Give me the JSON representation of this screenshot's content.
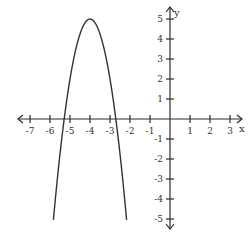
{
  "chart_data": {
    "type": "line",
    "title": "",
    "xlabel": "x",
    "ylabel": "y",
    "xlim": [
      -7.6,
      3.6
    ],
    "ylim": [
      -5.5,
      5.6
    ],
    "x_ticks": [
      -7,
      -6,
      -5,
      -4,
      -3,
      -2,
      -1,
      1,
      2,
      3
    ],
    "y_ticks": [
      -5,
      -4,
      -3,
      -2,
      -1,
      1,
      2,
      3,
      4,
      5
    ],
    "x_tick_labels": [
      "-7",
      "-6",
      "-5",
      "-4",
      "-3",
      "-2",
      "-1",
      "1",
      "2",
      "3"
    ],
    "y_tick_labels": [
      "-5",
      "-4",
      "-3",
      "-2",
      "-1",
      "1",
      "2",
      "3",
      "4",
      "5"
    ],
    "grid": false,
    "series": [
      {
        "name": "parabola",
        "equation": "y = -3(x + 4)^2 + 5",
        "vertex": [
          -4,
          5
        ],
        "x_intercepts": [
          -5.29,
          -2.71
        ],
        "x_range": [
          -5.83,
          -2.17
        ],
        "points": [
          [
            -5.83,
            -5
          ],
          [
            -5.5,
            -1.75
          ],
          [
            -5.29,
            0
          ],
          [
            -5,
            2
          ],
          [
            -4.5,
            4.25
          ],
          [
            -4,
            5
          ],
          [
            -3.5,
            4.25
          ],
          [
            -3,
            2
          ],
          [
            -2.71,
            0
          ],
          [
            -2.5,
            -1.75
          ],
          [
            -2.17,
            -5
          ]
        ]
      }
    ]
  }
}
